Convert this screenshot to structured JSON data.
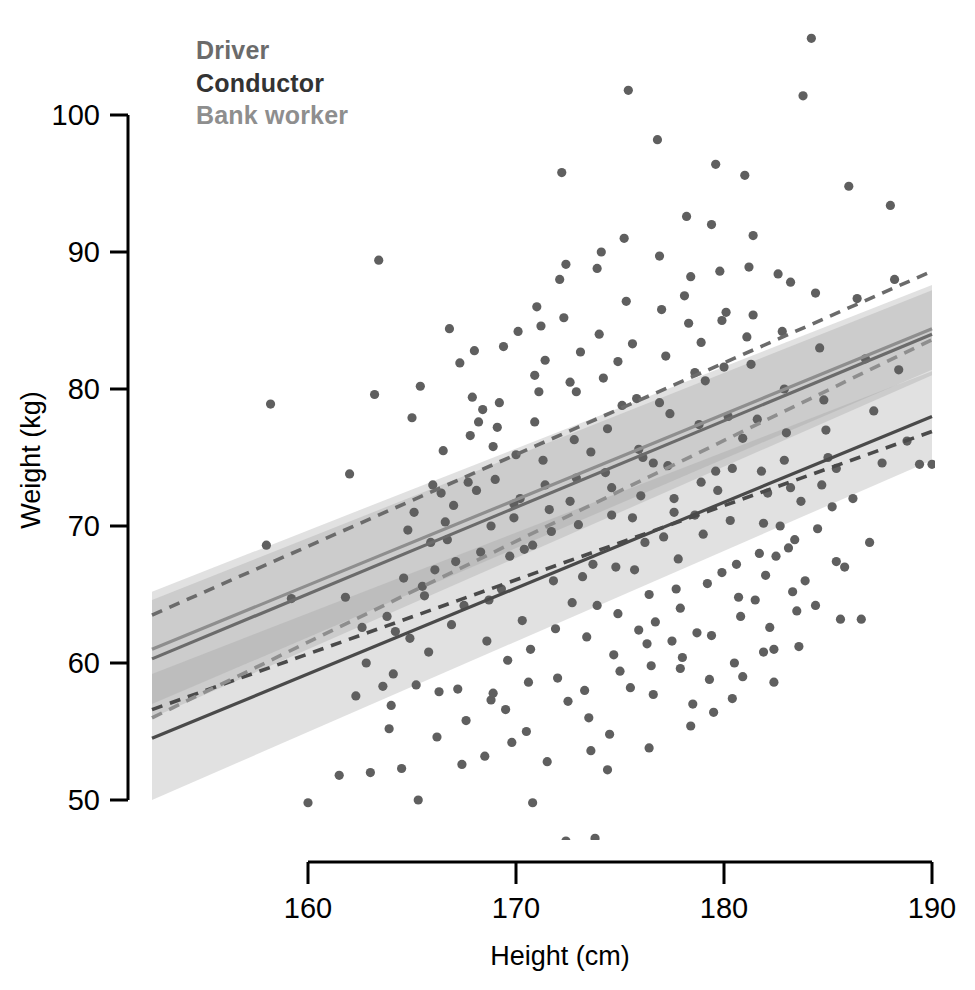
{
  "chart_data": {
    "type": "scatter",
    "title": "",
    "xlabel": "Height (cm)",
    "ylabel": "Weight (kg)",
    "xlim": [
      152.5,
      190
    ],
    "ylim": [
      45,
      102
    ],
    "x_ticks": [
      160,
      170,
      180,
      190
    ],
    "y_ticks": [
      50,
      60,
      70,
      80,
      90,
      100
    ],
    "grid": false,
    "legend_position": "top-left",
    "legend": [
      {
        "label": "Driver",
        "color": "#6b6b6b"
      },
      {
        "label": "Conductor",
        "color": "#333333"
      },
      {
        "label": "Bank worker",
        "color": "#8e8e8e"
      }
    ],
    "point_color": "#5f5f5f",
    "point_radius": 4.6,
    "band_color": "#9a9a9a",
    "series": [
      {
        "name": "Driver",
        "line_style": "solid",
        "color": "#6b6b6b",
        "fit": {
          "x0": 152.5,
          "y0": 60.3,
          "x1": 190.0,
          "y1": 84.0
        },
        "band": {
          "x0": 152.5,
          "lo0": 56.0,
          "hi0": 64.6,
          "x1": 190.0,
          "lo1": 81.0,
          "hi1": 87.2
        }
      },
      {
        "name": "Conductor",
        "line_style": "solid",
        "color": "#4a4a4a",
        "fit": {
          "x0": 152.5,
          "y0": 54.5,
          "x1": 190.0,
          "y1": 78.0
        },
        "band": {
          "x0": 152.5,
          "lo0": 50.0,
          "hi0": 59.2,
          "x1": 190.0,
          "lo1": 74.8,
          "hi1": 81.3
        }
      },
      {
        "name": "Bank worker",
        "line_style": "solid",
        "color": "#8e8e8e",
        "fit": {
          "x0": 152.5,
          "y0": 61.0,
          "x1": 190.0,
          "y1": 84.4
        },
        "band": {
          "x0": 152.5,
          "lo0": 57.0,
          "hi0": 65.2,
          "x1": 190.0,
          "lo1": 81.4,
          "hi1": 87.6
        }
      },
      {
        "name": "Driver prediction",
        "line_style": "dashed",
        "color": "#6b6b6b",
        "fit": {
          "x0": 152.5,
          "y0": 63.5,
          "x1": 190.0,
          "y1": 88.6
        }
      },
      {
        "name": "Conductor prediction",
        "line_style": "dashed",
        "color": "#4a4a4a",
        "fit": {
          "x0": 152.5,
          "y0": 56.6,
          "x1": 190.0,
          "y1": 76.9
        }
      },
      {
        "name": "Bank worker prediction",
        "line_style": "dashed",
        "color": "#8e8e8e",
        "fit": {
          "x0": 152.5,
          "y0": 56.0,
          "x1": 190.0,
          "y1": 83.6
        }
      }
    ],
    "points": [
      [
        160.0,
        49.8
      ],
      [
        158.2,
        78.9
      ],
      [
        158.0,
        68.6
      ],
      [
        159.2,
        64.7
      ],
      [
        160.0,
        46.6
      ],
      [
        161.5,
        51.8
      ],
      [
        162.3,
        57.6
      ],
      [
        162.0,
        73.8
      ],
      [
        163.4,
        89.4
      ],
      [
        163.2,
        79.6
      ],
      [
        163.0,
        52.0
      ],
      [
        163.6,
        58.3
      ],
      [
        164.0,
        56.9
      ],
      [
        164.5,
        52.3
      ],
      [
        164.2,
        62.3
      ],
      [
        164.8,
        69.7
      ],
      [
        165.0,
        77.9
      ],
      [
        165.4,
        80.2
      ],
      [
        165.2,
        58.4
      ],
      [
        165.6,
        64.9
      ],
      [
        166.0,
        73.0
      ],
      [
        166.3,
        57.9
      ],
      [
        166.1,
        66.8
      ],
      [
        166.6,
        70.3
      ],
      [
        166.8,
        84.4
      ],
      [
        167.0,
        71.5
      ],
      [
        167.2,
        58.1
      ],
      [
        167.4,
        52.6
      ],
      [
        167.5,
        64.2
      ],
      [
        167.8,
        76.6
      ],
      [
        167.9,
        79.4
      ],
      [
        168.0,
        82.8
      ],
      [
        168.2,
        77.6
      ],
      [
        168.4,
        78.5
      ],
      [
        168.3,
        68.1
      ],
      [
        168.6,
        61.6
      ],
      [
        168.8,
        57.3
      ],
      [
        168.9,
        57.8
      ],
      [
        169.0,
        73.4
      ],
      [
        169.2,
        79.0
      ],
      [
        169.4,
        83.1
      ],
      [
        169.3,
        65.4
      ],
      [
        169.6,
        60.2
      ],
      [
        169.8,
        54.2
      ],
      [
        169.9,
        70.6
      ],
      [
        170.0,
        75.2
      ],
      [
        170.2,
        72.0
      ],
      [
        170.4,
        68.3
      ],
      [
        170.3,
        63.1
      ],
      [
        170.6,
        58.6
      ],
      [
        170.8,
        49.8
      ],
      [
        170.9,
        81.0
      ],
      [
        171.0,
        86.0
      ],
      [
        171.2,
        84.6
      ],
      [
        171.4,
        82.1
      ],
      [
        171.3,
        74.8
      ],
      [
        171.6,
        71.2
      ],
      [
        171.8,
        66.0
      ],
      [
        171.9,
        62.5
      ],
      [
        172.0,
        58.9
      ],
      [
        172.2,
        95.8
      ],
      [
        172.4,
        89.1
      ],
      [
        172.3,
        85.2
      ],
      [
        172.6,
        80.5
      ],
      [
        172.8,
        76.3
      ],
      [
        172.9,
        73.5
      ],
      [
        173.0,
        70.1
      ],
      [
        173.2,
        66.3
      ],
      [
        173.4,
        61.9
      ],
      [
        173.3,
        58.0
      ],
      [
        173.6,
        53.6
      ],
      [
        173.8,
        47.2
      ],
      [
        173.9,
        88.8
      ],
      [
        174.0,
        84.0
      ],
      [
        174.2,
        80.8
      ],
      [
        174.4,
        77.1
      ],
      [
        174.3,
        73.9
      ],
      [
        174.6,
        70.8
      ],
      [
        174.8,
        67.0
      ],
      [
        174.9,
        63.6
      ],
      [
        175.0,
        59.4
      ],
      [
        175.2,
        91.0
      ],
      [
        175.4,
        101.8
      ],
      [
        175.3,
        86.4
      ],
      [
        175.6,
        83.3
      ],
      [
        175.8,
        79.3
      ],
      [
        175.9,
        75.6
      ],
      [
        176.0,
        72.2
      ],
      [
        176.2,
        68.8
      ],
      [
        176.4,
        65.0
      ],
      [
        176.3,
        61.4
      ],
      [
        176.6,
        57.7
      ],
      [
        176.8,
        98.2
      ],
      [
        176.9,
        89.7
      ],
      [
        177.0,
        85.8
      ],
      [
        177.2,
        82.4
      ],
      [
        177.4,
        78.2
      ],
      [
        177.3,
        74.4
      ],
      [
        177.6,
        71.0
      ],
      [
        177.8,
        67.6
      ],
      [
        177.9,
        64.0
      ],
      [
        178.0,
        60.4
      ],
      [
        178.2,
        92.6
      ],
      [
        178.4,
        88.2
      ],
      [
        178.3,
        84.8
      ],
      [
        178.6,
        81.2
      ],
      [
        178.8,
        77.4
      ],
      [
        178.9,
        73.2
      ],
      [
        179.0,
        69.4
      ],
      [
        179.2,
        65.8
      ],
      [
        179.4,
        62.0
      ],
      [
        179.3,
        58.8
      ],
      [
        179.6,
        96.4
      ],
      [
        179.8,
        88.6
      ],
      [
        179.9,
        85.0
      ],
      [
        180.0,
        81.6
      ],
      [
        180.2,
        78.0
      ],
      [
        180.4,
        74.2
      ],
      [
        180.3,
        70.4
      ],
      [
        180.6,
        67.2
      ],
      [
        180.8,
        63.4
      ],
      [
        180.9,
        59.0
      ],
      [
        181.0,
        95.6
      ],
      [
        181.2,
        88.9
      ],
      [
        181.4,
        85.4
      ],
      [
        181.3,
        81.8
      ],
      [
        181.6,
        77.8
      ],
      [
        181.8,
        74.0
      ],
      [
        181.9,
        70.2
      ],
      [
        182.0,
        66.4
      ],
      [
        182.2,
        62.6
      ],
      [
        182.4,
        58.6
      ],
      [
        182.6,
        88.4
      ],
      [
        182.8,
        84.2
      ],
      [
        182.9,
        80.0
      ],
      [
        183.0,
        76.8
      ],
      [
        183.2,
        72.8
      ],
      [
        183.4,
        69.0
      ],
      [
        183.3,
        65.2
      ],
      [
        183.6,
        61.2
      ],
      [
        183.8,
        101.4
      ],
      [
        184.2,
        105.6
      ],
      [
        184.4,
        87.0
      ],
      [
        184.6,
        83.0
      ],
      [
        184.8,
        79.2
      ],
      [
        185.0,
        75.0
      ],
      [
        185.2,
        71.4
      ],
      [
        185.4,
        67.4
      ],
      [
        185.6,
        63.2
      ],
      [
        186.0,
        94.8
      ],
      [
        186.4,
        86.6
      ],
      [
        186.8,
        82.2
      ],
      [
        187.2,
        78.4
      ],
      [
        187.6,
        74.6
      ],
      [
        188.0,
        93.4
      ],
      [
        188.4,
        81.4
      ],
      [
        188.8,
        76.2
      ],
      [
        189.4,
        74.5
      ],
      [
        190.0,
        74.5
      ],
      [
        166.5,
        75.5
      ],
      [
        167.3,
        81.9
      ],
      [
        168.1,
        72.6
      ],
      [
        169.1,
        77.2
      ],
      [
        170.1,
        84.2
      ],
      [
        171.1,
        79.8
      ],
      [
        172.1,
        88.0
      ],
      [
        173.1,
        82.7
      ],
      [
        174.1,
        90.0
      ],
      [
        175.1,
        78.8
      ],
      [
        176.1,
        75.0
      ],
      [
        177.1,
        69.2
      ],
      [
        178.1,
        86.8
      ],
      [
        179.1,
        80.6
      ],
      [
        180.1,
        85.6
      ],
      [
        181.1,
        83.8
      ],
      [
        182.1,
        72.4
      ],
      [
        183.1,
        68.4
      ],
      [
        165.8,
        60.8
      ],
      [
        166.2,
        54.6
      ],
      [
        167.6,
        55.8
      ],
      [
        168.5,
        53.2
      ],
      [
        169.5,
        56.6
      ],
      [
        170.5,
        55.0
      ],
      [
        171.5,
        52.8
      ],
      [
        172.5,
        57.2
      ],
      [
        173.5,
        56.0
      ],
      [
        174.5,
        54.8
      ],
      [
        175.5,
        58.2
      ],
      [
        176.5,
        59.8
      ],
      [
        177.5,
        61.6
      ],
      [
        178.5,
        57.0
      ],
      [
        179.5,
        56.4
      ],
      [
        180.5,
        60.0
      ],
      [
        181.5,
        64.6
      ],
      [
        182.5,
        67.8
      ],
      [
        183.5,
        63.8
      ],
      [
        184.5,
        69.8
      ],
      [
        185.8,
        67.0
      ],
      [
        186.2,
        72.0
      ],
      [
        164.6,
        66.2
      ],
      [
        165.1,
        71.0
      ],
      [
        166.9,
        62.8
      ],
      [
        168.7,
        64.6
      ],
      [
        170.7,
        61.0
      ],
      [
        172.7,
        64.4
      ],
      [
        174.7,
        60.6
      ],
      [
        176.7,
        63.0
      ],
      [
        178.7,
        62.2
      ],
      [
        180.7,
        64.8
      ],
      [
        182.7,
        70.0
      ],
      [
        184.7,
        73.0
      ],
      [
        163.8,
        63.4
      ],
      [
        165.9,
        68.8
      ],
      [
        167.1,
        67.4
      ],
      [
        169.7,
        67.8
      ],
      [
        171.7,
        69.6
      ],
      [
        173.7,
        67.2
      ],
      [
        175.7,
        66.8
      ],
      [
        177.7,
        65.4
      ],
      [
        179.7,
        72.6
      ],
      [
        181.7,
        68.0
      ],
      [
        183.7,
        71.8
      ],
      [
        162.8,
        60.0
      ],
      [
        164.9,
        61.8
      ],
      [
        166.4,
        72.4
      ],
      [
        168.9,
        75.8
      ],
      [
        170.9,
        77.6
      ],
      [
        172.9,
        79.8
      ],
      [
        174.9,
        82.0
      ],
      [
        176.9,
        79.0
      ],
      [
        178.9,
        83.4
      ],
      [
        180.9,
        76.4
      ],
      [
        182.9,
        74.8
      ],
      [
        184.9,
        77.0
      ],
      [
        171.4,
        73.0
      ],
      [
        172.6,
        71.8
      ],
      [
        173.6,
        75.4
      ],
      [
        174.6,
        72.8
      ],
      [
        175.6,
        70.6
      ],
      [
        176.6,
        74.6
      ],
      [
        177.6,
        72.0
      ],
      [
        178.6,
        70.8
      ],
      [
        179.6,
        74.0
      ],
      [
        167.7,
        73.2
      ],
      [
        169.9,
        71.6
      ],
      [
        168.8,
        70.0
      ],
      [
        170.8,
        68.6
      ],
      [
        166.7,
        69.0
      ],
      [
        165.5,
        65.6
      ],
      [
        173.9,
        64.2
      ],
      [
        175.9,
        62.4
      ],
      [
        177.9,
        59.6
      ],
      [
        179.9,
        66.6
      ],
      [
        181.9,
        60.8
      ],
      [
        183.9,
        66.0
      ],
      [
        161.8,
        64.8
      ],
      [
        162.6,
        62.6
      ],
      [
        164.1,
        59.2
      ],
      [
        163.9,
        55.2
      ],
      [
        165.3,
        50.0
      ],
      [
        172.4,
        47.0
      ],
      [
        174.4,
        52.2
      ],
      [
        176.4,
        53.8
      ],
      [
        178.4,
        55.4
      ],
      [
        180.4,
        57.4
      ],
      [
        182.4,
        61.0
      ],
      [
        184.4,
        64.2
      ],
      [
        186.6,
        63.2
      ],
      [
        188.2,
        88.0
      ],
      [
        187.0,
        68.8
      ],
      [
        185.4,
        74.2
      ],
      [
        183.2,
        87.8
      ],
      [
        181.4,
        91.2
      ],
      [
        179.4,
        92.0
      ]
    ]
  }
}
